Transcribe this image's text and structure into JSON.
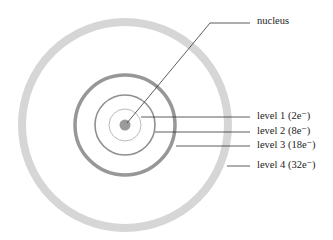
{
  "diagram": {
    "type": "atomic-shell-model",
    "center": [
      125,
      125
    ],
    "colors": {
      "nucleus": "#9a9a9a",
      "level1": "#a8a8a8",
      "level2": "#8f8f8f",
      "level3": "#979797",
      "level4": "#d6d6d6",
      "leader": "#333333",
      "text": "#222222"
    },
    "labels": {
      "nucleus": "nucleus",
      "level1": "level 1 (2e⁻)",
      "level2": "level 2 (8e⁻)",
      "level3": "level 3 (18e⁻)",
      "level4": "level 4 (32e⁻)"
    },
    "shells": [
      {
        "name": "level 1",
        "capacity": "2e⁻",
        "radius": 16
      },
      {
        "name": "level 2",
        "capacity": "8e⁻",
        "radius": 30
      },
      {
        "name": "level 3",
        "capacity": "18e⁻",
        "radius": 50
      },
      {
        "name": "level 4",
        "capacity": "32e⁻",
        "radius": 103
      }
    ]
  }
}
